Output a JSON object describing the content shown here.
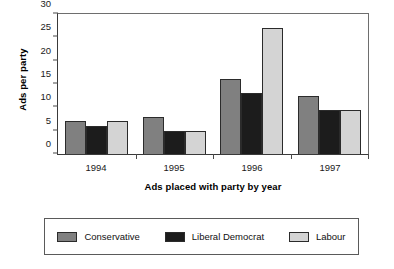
{
  "chart_data": {
    "type": "bar",
    "title": "",
    "xlabel": "Ads placed with party by year",
    "ylabel": "Ads per party",
    "categories": [
      "1994",
      "1995",
      "1996",
      "1997"
    ],
    "series": [
      {
        "name": "Conservative",
        "color": "#808080",
        "values": [
          7,
          8,
          16,
          12.5
        ]
      },
      {
        "name": "Liberal Democrat",
        "color": "#1c1c1c",
        "values": [
          6,
          5,
          13,
          9.5
        ]
      },
      {
        "name": "Labour",
        "color": "#d4d4d4",
        "values": [
          7,
          5,
          27,
          9.5
        ]
      }
    ],
    "ylim": [
      0,
      30
    ],
    "yticks": [
      0,
      5,
      10,
      15,
      20,
      25,
      30
    ],
    "ytick_labels": [
      "0",
      "5",
      "10",
      "15",
      "20",
      "25",
      "30"
    ],
    "grid": false,
    "legend_position": "bottom"
  }
}
